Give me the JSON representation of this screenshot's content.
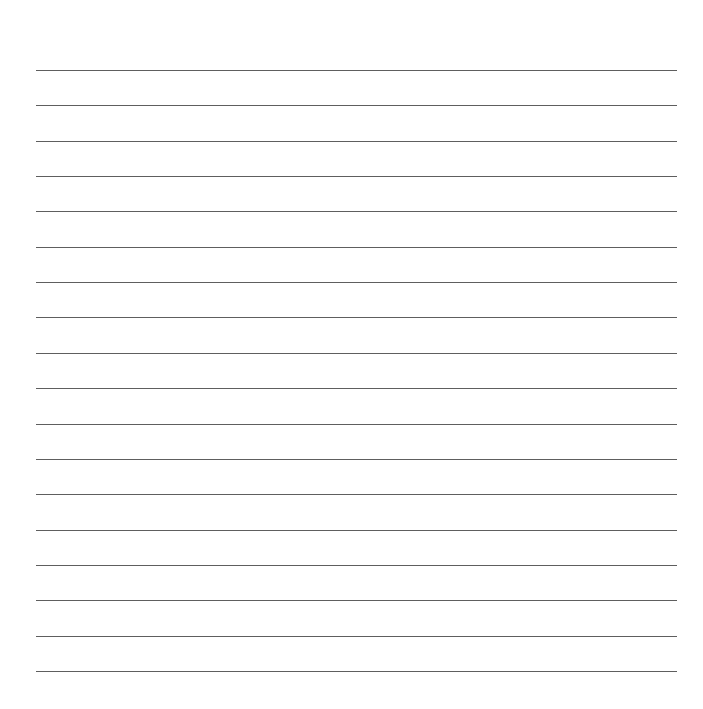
{
  "page": {
    "type": "lined-paper",
    "background": "#ffffff",
    "line_color": "#5e5e5e",
    "line_count": 18,
    "line_left": 36,
    "line_right": 677,
    "first_line_y": 70,
    "line_spacing": 35.35
  }
}
